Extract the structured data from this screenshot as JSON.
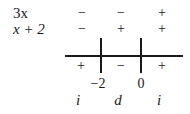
{
  "rows": [
    {
      "label": "3x",
      "signs": [
        "−",
        "−",
        "+"
      ]
    },
    {
      "label": "x + 2",
      "signs": [
        "−",
        "+",
        "+"
      ]
    }
  ],
  "product_signs": [
    "+",
    "−",
    "+"
  ],
  "critical_points": [
    "−2",
    "0"
  ],
  "monotonicity": [
    "i",
    "d",
    "i"
  ]
}
